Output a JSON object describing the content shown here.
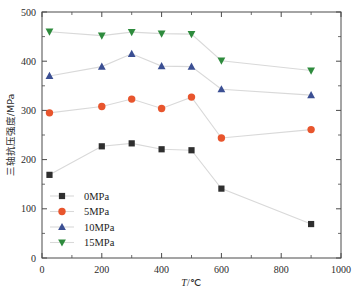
{
  "chart_data": {
    "type": "line",
    "title": "",
    "xlabel": "T/℃",
    "ylabel": "三轴抗压强度/MPa",
    "xlim": [
      0,
      1000
    ],
    "ylim": [
      0,
      500
    ],
    "xticks": [
      "0",
      "200",
      "400",
      "600",
      "800",
      "1000"
    ],
    "xtick_values": [
      0,
      200,
      400,
      600,
      800,
      1000
    ],
    "yticks": [
      "0",
      "100",
      "200",
      "300",
      "400",
      "500"
    ],
    "ytick_values": [
      0,
      100,
      200,
      300,
      400,
      500
    ],
    "x": [
      25,
      200,
      300,
      400,
      500,
      600,
      900
    ],
    "grid": false,
    "legend_position": "lower-left-inside",
    "series": [
      {
        "name": "0MPa",
        "label": "0MPa",
        "color": "#2f2f2f",
        "marker": "square",
        "values": [
          169,
          227,
          233,
          221,
          219,
          141,
          69
        ]
      },
      {
        "name": "5MPa",
        "label": "5MPa",
        "color": "#e8552d",
        "marker": "circle",
        "values": [
          295,
          308,
          323,
          304,
          327,
          244,
          261
        ]
      },
      {
        "name": "10MPa",
        "label": "10MPa",
        "color": "#3b4f93",
        "marker": "triangle-up",
        "values": [
          370,
          389,
          415,
          390,
          389,
          343,
          331
        ]
      },
      {
        "name": "15MPa",
        "label": "15MPa",
        "color": "#2e8b3d",
        "marker": "triangle-down",
        "values": [
          460,
          452,
          459,
          456,
          455,
          401,
          381
        ]
      }
    ]
  },
  "axes": {
    "x_title": "T/℃",
    "x_title_italic_part": "T",
    "x_title_rest": "/℃",
    "y_title": "三轴抗压强度/MPa"
  },
  "legend": {
    "items": [
      {
        "label": "0MPa",
        "color": "#2f2f2f",
        "marker": "square"
      },
      {
        "label": "5MPa",
        "color": "#e8552d",
        "marker": "circle"
      },
      {
        "label": "10MPa",
        "color": "#3b4f93",
        "marker": "triangle-up"
      },
      {
        "label": "15MPa",
        "color": "#2e8b3d",
        "marker": "triangle-down"
      }
    ]
  },
  "style": {
    "axis_color": "#4a4a4a",
    "line_color": "#d9d9d9",
    "background": "#ffffff"
  }
}
